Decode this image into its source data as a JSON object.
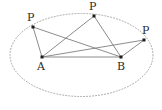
{
  "figure": {
    "kind": "geometry-diagram",
    "width": 162,
    "height": 110,
    "background_color": "#ffffff",
    "ellipse": {
      "name": "ellipse-outline",
      "center_x": 81.5,
      "center_y": 55,
      "radius_x": 71.5,
      "radius_y": 41.5,
      "stroke_color": "#9a9a9a",
      "stroke_width": 0.9,
      "dash_pattern": "1,2",
      "fill": "none"
    },
    "segment_style": {
      "stroke_color": "#6f6f6f",
      "stroke_width": 0.8
    },
    "point_style": {
      "fill_color": "#1c1c1c",
      "size": 3
    },
    "label_color": "#2b2b2b",
    "label_font_size": 11,
    "points": [
      {
        "id": "p-left",
        "label": "P",
        "x": 33,
        "y": 27,
        "label_x": 27,
        "label_y": 12
      },
      {
        "id": "p-top",
        "label": "P",
        "x": 94,
        "y": 16,
        "label_x": 89,
        "label_y": 1
      },
      {
        "id": "p-right",
        "label": "P",
        "x": 144,
        "y": 40,
        "label_x": 142,
        "label_y": 25
      },
      {
        "id": "a",
        "label": "A",
        "x": 42,
        "y": 57,
        "label_x": 37,
        "label_y": 61
      },
      {
        "id": "b",
        "label": "B",
        "x": 121,
        "y": 57,
        "label_x": 117,
        "label_y": 61
      }
    ],
    "segments": [
      {
        "id": "seg-pleft-a",
        "from": "p-left",
        "to": "a"
      },
      {
        "id": "seg-pleft-b",
        "from": "p-left",
        "to": "b"
      },
      {
        "id": "seg-ptop-a",
        "from": "p-top",
        "to": "a"
      },
      {
        "id": "seg-ptop-b",
        "from": "p-top",
        "to": "b"
      },
      {
        "id": "seg-pright-a",
        "from": "p-right",
        "to": "a"
      },
      {
        "id": "seg-pright-b",
        "from": "p-right",
        "to": "b"
      },
      {
        "id": "seg-a-b",
        "from": "a",
        "to": "b"
      }
    ]
  }
}
